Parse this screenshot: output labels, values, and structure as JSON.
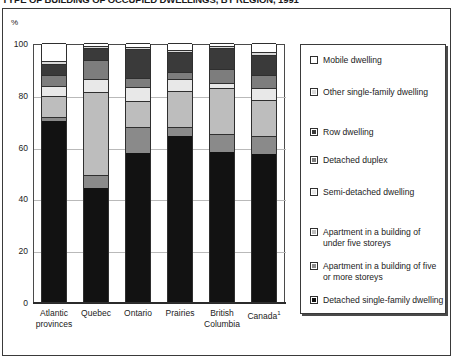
{
  "figure": {
    "title": "TYPE OF BUILDING OF OCCUPIED DWELLINGS, BY REGION, 1991",
    "unit_label": "%"
  },
  "legend": {
    "items": [
      {
        "label": "Mobile dwelling",
        "color": "#ffffff",
        "swatch_name": "legend-swatch-mobile-dwelling"
      },
      {
        "label": "Other single-family dwelling",
        "color": "#d9d9d9",
        "swatch_name": "legend-swatch-other-single-family-dwelling"
      },
      {
        "label": "Row dwelling",
        "color": "#3a3a3a",
        "swatch_name": "legend-swatch-row-dwelling"
      },
      {
        "label": "Detached duplex",
        "color": "#7d7d7d",
        "swatch_name": "legend-swatch-detached-duplex"
      },
      {
        "label": "Semi-detached dwelling",
        "color": "#e8e8e8",
        "swatch_name": "legend-swatch-semi-detached-dwelling"
      },
      {
        "label": "Apartment in a building of under five storeys",
        "color": "#bdbdbd",
        "swatch_name": "legend-swatch-apartment-under-five-storeys"
      },
      {
        "label": "Apartment in a building of five or more storeys",
        "color": "#8a8a8a",
        "swatch_name": "legend-swatch-apartment-five-or-more-storeys"
      },
      {
        "label": "Detached single-family dwelling",
        "color": "#121212",
        "swatch_name": "legend-swatch-detached-single-family-dwelling"
      }
    ]
  },
  "chart_data": {
    "type": "bar",
    "title": "TYPE OF BUILDING OF OCCUPIED DWELLINGS, BY REGION, 1991",
    "subtitle": "",
    "xlabel": "",
    "ylabel": "%",
    "ylim": [
      0,
      100
    ],
    "yticks": [
      0,
      20,
      40,
      60,
      80,
      100
    ],
    "grid": true,
    "stacked": true,
    "legend_position": "right",
    "categories": [
      "Atlantic provinces",
      "Quebec",
      "Ontario",
      "Prairies",
      "British Columbia",
      "Canada¹"
    ],
    "series": [
      {
        "name": "Detached single-family dwelling",
        "color": "#121212",
        "values": [
          70.0,
          44.0,
          57.5,
          64.0,
          58.0,
          57.0
        ]
      },
      {
        "name": "Apartment in a building of five or more storeys",
        "color": "#8a8a8a",
        "values": [
          1.5,
          5.0,
          10.0,
          3.5,
          7.0,
          7.0
        ]
      },
      {
        "name": "Apartment in a building of under five storeys",
        "color": "#bdbdbd",
        "values": [
          8.0,
          32.0,
          10.0,
          14.0,
          17.5,
          14.0
        ]
      },
      {
        "name": "Semi-detached dwelling",
        "color": "#e8e8e8",
        "values": [
          4.0,
          5.0,
          5.5,
          4.5,
          2.0,
          4.5
        ]
      },
      {
        "name": "Detached duplex",
        "color": "#7d7d7d",
        "values": [
          4.0,
          7.5,
          3.5,
          3.0,
          5.5,
          5.0
        ]
      },
      {
        "name": "Row dwelling",
        "color": "#3a3a3a",
        "values": [
          4.5,
          4.5,
          11.0,
          7.5,
          8.0,
          8.0
        ]
      },
      {
        "name": "Other single-family dwelling",
        "color": "#d9d9d9",
        "values": [
          1.0,
          1.0,
          1.0,
          1.0,
          1.0,
          1.0
        ]
      },
      {
        "name": "Mobile dwelling",
        "color": "#ffffff",
        "values": [
          7.0,
          1.0,
          1.5,
          2.5,
          1.0,
          3.5
        ]
      }
    ],
    "ytick_labels": [
      "0",
      "20",
      "40",
      "60",
      "80",
      "100"
    ]
  }
}
